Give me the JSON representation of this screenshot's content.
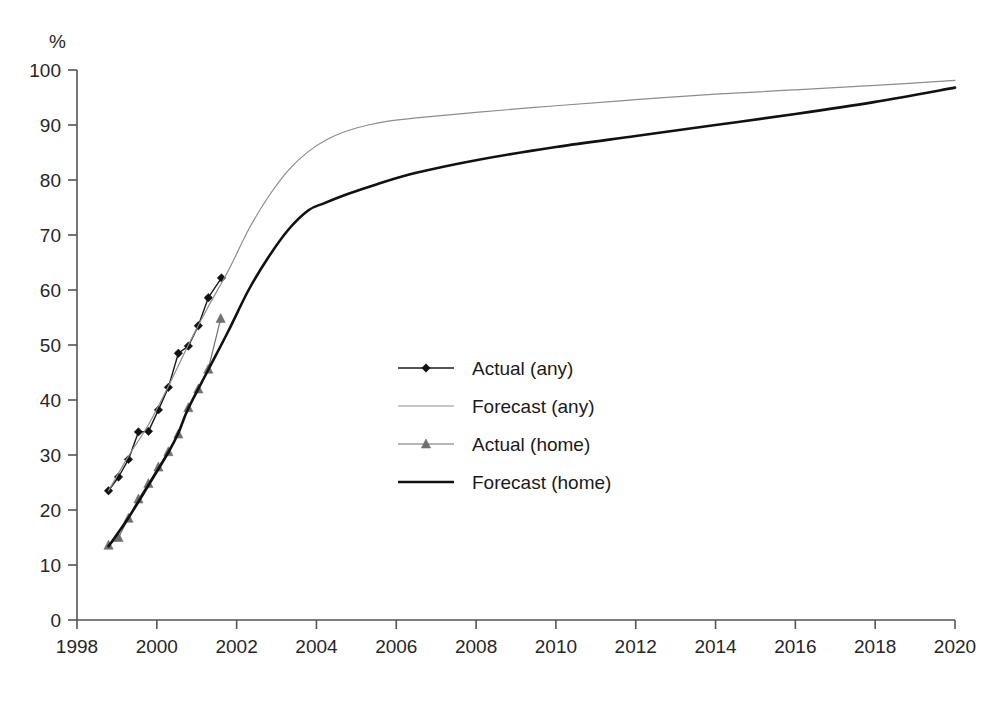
{
  "chart_data": {
    "type": "line",
    "title": "",
    "subtitle": "",
    "xlabel": "",
    "ylabel": "%",
    "unit_label": "%",
    "xlim": [
      1998,
      2020
    ],
    "ylim": [
      0,
      100
    ],
    "xticks": [
      1998,
      2000,
      2002,
      2004,
      2006,
      2008,
      2010,
      2012,
      2014,
      2016,
      2018,
      2020
    ],
    "xtick_labels": [
      "1998",
      "2000",
      "2002",
      "2004",
      "2006",
      "2008",
      "2010",
      "2012",
      "2014",
      "2016",
      "2018",
      "2020"
    ],
    "yticks": [
      0,
      10,
      20,
      30,
      40,
      50,
      60,
      70,
      80,
      90,
      100
    ],
    "ytick_labels": [
      "0",
      "10",
      "20",
      "30",
      "40",
      "50",
      "60",
      "70",
      "80",
      "90",
      "100"
    ],
    "grid": false,
    "legend_position": "center",
    "series": [
      {
        "name": "Actual (any)",
        "key": "actual_any",
        "style": "line+marker",
        "marker": "diamond",
        "color": "#1a1a1a",
        "marker_color": "#111111",
        "line_width": 1.4,
        "points": [
          [
            1998.79,
            23.5
          ],
          [
            1999.04,
            26.0
          ],
          [
            1999.29,
            29.2
          ],
          [
            1999.54,
            34.2
          ],
          [
            1999.79,
            34.3
          ],
          [
            2000.04,
            38.2
          ],
          [
            2000.29,
            42.3
          ],
          [
            2000.54,
            48.5
          ],
          [
            2000.79,
            49.8
          ],
          [
            2001.04,
            53.5
          ],
          [
            2001.29,
            58.6
          ],
          [
            2001.62,
            62.2
          ]
        ]
      },
      {
        "name": "Forecast (any)",
        "key": "forecast_any",
        "style": "line",
        "marker": "none",
        "color": "#8c8c8c",
        "line_width": 1.2,
        "points": [
          [
            1998.79,
            23.5
          ],
          [
            1999.29,
            29.8
          ],
          [
            1999.79,
            35.5
          ],
          [
            2000.29,
            42.5
          ],
          [
            2000.79,
            50.0
          ],
          [
            2001.29,
            57.0
          ],
          [
            2001.79,
            63.5
          ],
          [
            2002.3,
            71.0
          ],
          [
            2002.8,
            77.0
          ],
          [
            2003.3,
            81.8
          ],
          [
            2003.8,
            85.2
          ],
          [
            2004.3,
            87.5
          ],
          [
            2004.8,
            89.0
          ],
          [
            2005.3,
            90.0
          ],
          [
            2005.8,
            90.7
          ],
          [
            2006.5,
            91.3
          ],
          [
            2008.0,
            92.3
          ],
          [
            2010.0,
            93.5
          ],
          [
            2012.0,
            94.6
          ],
          [
            2014.0,
            95.6
          ],
          [
            2016.0,
            96.4
          ],
          [
            2018.0,
            97.2
          ],
          [
            2020.0,
            98.1
          ]
        ]
      },
      {
        "name": "Actual (home)",
        "key": "actual_home",
        "style": "line+marker",
        "marker": "triangle",
        "color": "#6e6e6e",
        "marker_color": "#707070",
        "line_width": 1.2,
        "points": [
          [
            1998.79,
            13.6
          ],
          [
            1999.04,
            15.0
          ],
          [
            1999.29,
            18.5
          ],
          [
            1999.54,
            22.0
          ],
          [
            1999.79,
            24.8
          ],
          [
            2000.04,
            27.8
          ],
          [
            2000.29,
            30.6
          ],
          [
            2000.54,
            33.8
          ],
          [
            2000.79,
            38.6
          ],
          [
            2001.04,
            42.0
          ],
          [
            2001.29,
            45.6
          ],
          [
            2001.6,
            54.8
          ]
        ]
      },
      {
        "name": "Forecast (home)",
        "key": "forecast_home",
        "style": "line",
        "marker": "none",
        "color": "#111111",
        "line_width": 2.6,
        "points": [
          [
            1998.79,
            13.4
          ],
          [
            1999.29,
            18.6
          ],
          [
            1999.79,
            24.5
          ],
          [
            2000.29,
            30.5
          ],
          [
            2000.54,
            34.0
          ],
          [
            2000.79,
            38.5
          ],
          [
            2001.29,
            45.5
          ],
          [
            2001.79,
            52.5
          ],
          [
            2002.3,
            60.0
          ],
          [
            2002.8,
            66.0
          ],
          [
            2003.3,
            71.0
          ],
          [
            2003.8,
            74.5
          ],
          [
            2004.2,
            75.8
          ],
          [
            2004.8,
            77.5
          ],
          [
            2005.5,
            79.2
          ],
          [
            2006.5,
            81.3
          ],
          [
            2008.0,
            83.6
          ],
          [
            2010.0,
            86.0
          ],
          [
            2012.0,
            88.0
          ],
          [
            2014.0,
            90.0
          ],
          [
            2016.0,
            92.0
          ],
          [
            2018.0,
            94.2
          ],
          [
            2020.0,
            96.8
          ]
        ]
      }
    ],
    "legend_entries": [
      {
        "label": "Actual (any)",
        "key": "actual_any"
      },
      {
        "label": "Forecast (any)",
        "key": "forecast_any"
      },
      {
        "label": "Actual (home)",
        "key": "actual_home"
      },
      {
        "label": "Forecast (home)",
        "key": "forecast_home"
      }
    ]
  }
}
